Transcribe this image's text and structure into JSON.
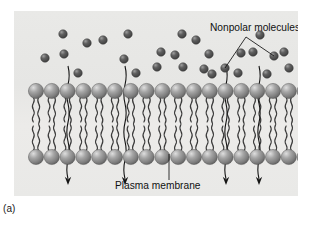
{
  "figure": {
    "caption": "(a)",
    "panel_color": "#e8e8e6",
    "background_color": "#ffffff"
  },
  "labels": {
    "nonpolar": {
      "text": "Nonpolar molecules",
      "x": 196,
      "y": 20,
      "leader_apex": {
        "x": 232,
        "y": 26
      },
      "leader_targets": [
        {
          "x": 211,
          "y": 57
        },
        {
          "x": 260,
          "y": 45
        }
      ]
    },
    "plasma_membrane": {
      "text": "Plasma membrane",
      "x": 101,
      "y": 178,
      "leader_from": {
        "x": 155,
        "y": 169
      },
      "leader_to": {
        "x": 155,
        "y": 143
      }
    }
  },
  "membrane": {
    "head_color": "#8f8f8f",
    "head_highlight": "#d8d8d8",
    "head_shadow": "#5c5c5c",
    "tail_color": "#3a3a3a",
    "head_count": 18,
    "spacing": 15.8,
    "first_x": 22,
    "upper_head_y": 80,
    "lower_head_y": 146,
    "head_radius": 7.6,
    "upper_tail_top": 86,
    "upper_tail_bottom": 111,
    "lower_tail_top": 140,
    "lower_tail_bottom": 115
  },
  "molecules": {
    "fill": "#555555",
    "highlight": "#9a9a9a",
    "radius": 4.3,
    "positions": [
      {
        "x": 31,
        "y": 47
      },
      {
        "x": 49,
        "y": 23
      },
      {
        "x": 50,
        "y": 43
      },
      {
        "x": 64,
        "y": 62
      },
      {
        "x": 73,
        "y": 32
      },
      {
        "x": 89,
        "y": 29
      },
      {
        "x": 110,
        "y": 48
      },
      {
        "x": 114,
        "y": 23
      },
      {
        "x": 122,
        "y": 62
      },
      {
        "x": 143,
        "y": 56
      },
      {
        "x": 147,
        "y": 41
      },
      {
        "x": 161,
        "y": 44
      },
      {
        "x": 168,
        "y": 23
      },
      {
        "x": 169,
        "y": 56
      },
      {
        "x": 182,
        "y": 29
      },
      {
        "x": 190,
        "y": 58
      },
      {
        "x": 195,
        "y": 43
      },
      {
        "x": 198,
        "y": 63
      },
      {
        "x": 211,
        "y": 57
      },
      {
        "x": 224,
        "y": 62
      },
      {
        "x": 227,
        "y": 42
      },
      {
        "x": 239,
        "y": 41
      },
      {
        "x": 246,
        "y": 24
      },
      {
        "x": 253,
        "y": 63
      },
      {
        "x": 260,
        "y": 45
      },
      {
        "x": 270,
        "y": 41
      },
      {
        "x": 275,
        "y": 57
      },
      {
        "x": 289,
        "y": 56
      }
    ]
  },
  "diffusion_arrows": {
    "color": "#141414",
    "direction": "downward-through-membrane",
    "paths": [
      {
        "x": 54,
        "top": 55,
        "bottom": 168
      },
      {
        "x": 111,
        "top": 55,
        "bottom": 168
      },
      {
        "x": 212,
        "top": 55,
        "bottom": 168
      },
      {
        "x": 245,
        "top": 55,
        "bottom": 168
      }
    ]
  }
}
